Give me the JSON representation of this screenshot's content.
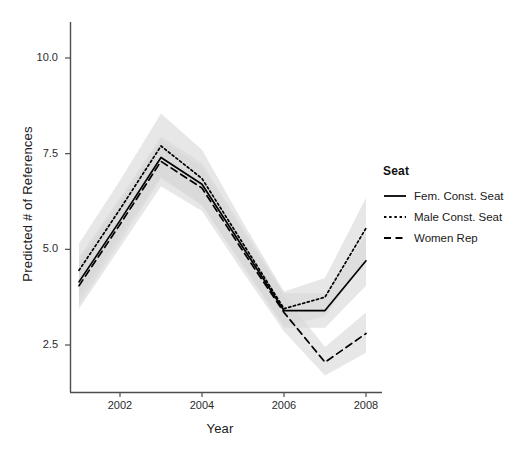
{
  "chart_data": {
    "type": "line",
    "title": "",
    "xlabel": "Year",
    "ylabel": "Predicted # of References",
    "xlim": [
      2001,
      2008
    ],
    "ylim": [
      1.55,
      10.75
    ],
    "xticks": [
      2002,
      2004,
      2006,
      2008
    ],
    "xticklabels": [
      "2002",
      "2004",
      "2006",
      "2008"
    ],
    "yticks": [
      2.5,
      5.0,
      7.5,
      10.0
    ],
    "yticklabels": [
      "2.5",
      "5.0",
      "7.5",
      "10.0"
    ],
    "grid": false,
    "legend_position": "right",
    "legend_title": "Seat",
    "x": [
      2001,
      2002,
      2003,
      2004,
      2005,
      2006,
      2007,
      2008
    ],
    "series": [
      {
        "name": "Fem. Const. Seat",
        "linestyle": "solid",
        "color": "#000000",
        "values": [
          4.15,
          5.75,
          7.4,
          6.7,
          5.05,
          3.4,
          3.4,
          4.7
        ],
        "ci_lower": [
          3.55,
          5.2,
          6.85,
          6.15,
          4.55,
          2.95,
          2.95,
          4.05
        ],
        "ci_upper": [
          4.8,
          6.35,
          7.95,
          7.25,
          5.55,
          3.85,
          3.85,
          5.4
        ]
      },
      {
        "name": "Male Const. Seat",
        "linestyle": "dotted",
        "color": "#000000",
        "values": [
          4.45,
          6.05,
          7.7,
          6.85,
          5.15,
          3.45,
          3.75,
          5.55
        ],
        "ci_lower": [
          3.75,
          5.35,
          6.9,
          6.15,
          4.6,
          3.0,
          3.25,
          4.75
        ],
        "ci_upper": [
          5.15,
          6.8,
          8.55,
          7.6,
          5.7,
          3.9,
          4.25,
          6.35
        ]
      },
      {
        "name": "Women Rep",
        "linestyle": "dashed",
        "color": "#000000",
        "values": [
          4.05,
          5.65,
          7.3,
          6.6,
          4.95,
          3.35,
          2.05,
          2.8
        ],
        "ci_lower": [
          3.45,
          5.05,
          6.65,
          6.0,
          4.4,
          2.85,
          1.7,
          2.3
        ],
        "ci_upper": [
          4.7,
          6.25,
          7.85,
          7.15,
          5.45,
          3.8,
          2.45,
          3.35
        ]
      }
    ],
    "ribbon_color": "#d9d9d9",
    "panel_background": "#ffffff"
  },
  "axes": {
    "x_title": "Year",
    "y_title": "Predicted # of References"
  },
  "legend": {
    "title": "Seat",
    "items": [
      {
        "label": "Fem. Const. Seat",
        "key": "solid-line-key"
      },
      {
        "label": "Male Const. Seat",
        "key": "dotted-line-key"
      },
      {
        "label": "Women Rep",
        "key": "dashed-line-key"
      }
    ]
  }
}
